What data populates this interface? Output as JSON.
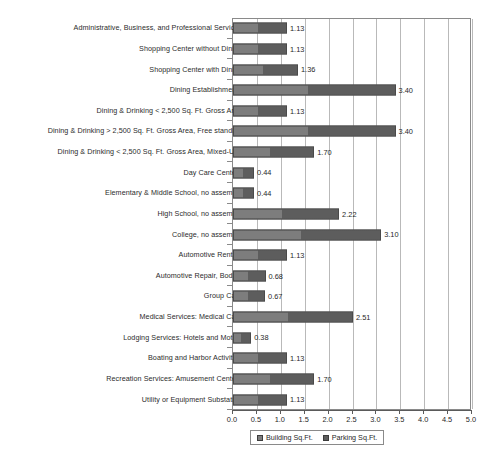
{
  "chart_data": {
    "type": "bar",
    "orientation": "horizontal",
    "title": "",
    "subtitle": "",
    "xlabel": "",
    "ylabel": "",
    "xlim": [
      0.0,
      5.0
    ],
    "xticks": [
      "0.0",
      "0.5",
      "1.0",
      "1.5",
      "2.0",
      "2.5",
      "3.0",
      "3.5",
      "4.0",
      "4.5",
      "5.0"
    ],
    "grid": true,
    "legend_position": "bottom",
    "legend": [
      "Building Sq.Ft.",
      "Parking Sq.Ft."
    ],
    "categories": [
      "Administrative, Business, and Professional Services",
      "Shopping Center without Dining",
      "Shopping Center with Dining",
      "Dining Establishments",
      "Dining & Drinking < 2,500 Sq. Ft. Gross Area",
      "Dining & Drinking > 2,500 Sq. Ft. Gross Area, Free standing",
      "Dining & Drinking < 2,500 Sq. Ft. Gross Area, Mixed-Use",
      "Day Care Centers",
      "Elementary & Middle School, no assembly",
      "High School, no assembly",
      "College, no assembly",
      "Automotive Rentals",
      "Automotive Repair, Bodies",
      "Group Care",
      "Medical Services: Medical Care",
      "Lodging Services: Hotels and Motels",
      "Boating and Harbor Activities",
      "Recreation Services: Amusement Centers",
      "Utility or Equipment Substation"
    ],
    "values": [
      1.13,
      1.13,
      1.36,
      3.4,
      1.13,
      3.4,
      1.7,
      0.44,
      0.44,
      2.22,
      3.1,
      1.13,
      0.68,
      0.67,
      2.51,
      0.38,
      1.13,
      1.7,
      1.13
    ],
    "value_labels": [
      "1.13",
      "1.13",
      "1.36",
      "3.40",
      "1.13",
      "3.40",
      "1.70",
      "0.44",
      "0.44",
      "2.22",
      "3.10",
      "1.13",
      "0.68",
      "0.67",
      "2.51",
      "0.38",
      "1.13",
      "1.70",
      "1.13"
    ],
    "series": [
      {
        "name": "Building Sq.Ft.",
        "color": "#7d7d7d",
        "values": [
          1.13,
          1.13,
          1.36,
          3.4,
          1.13,
          3.4,
          1.7,
          0.44,
          0.44,
          2.22,
          3.1,
          1.13,
          0.68,
          0.67,
          2.51,
          0.38,
          1.13,
          1.7,
          1.13
        ]
      },
      {
        "name": "Parking Sq.Ft.",
        "color": "#5d5d5d",
        "values": [
          1.13,
          1.13,
          1.36,
          3.4,
          1.13,
          3.4,
          1.7,
          0.44,
          0.44,
          2.22,
          3.1,
          1.13,
          0.68,
          0.67,
          2.51,
          0.38,
          1.13,
          1.7,
          1.13
        ]
      }
    ]
  },
  "legend": {
    "items": [
      {
        "label": "Building Sq.Ft.",
        "color": "#7d7d7d"
      },
      {
        "label": "Parking Sq.Ft.",
        "color": "#5d5d5d"
      }
    ]
  }
}
